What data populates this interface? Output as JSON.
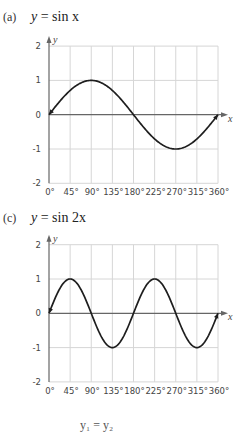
{
  "panels": [
    {
      "label": "(a)",
      "equation_lhs": "y",
      "equation_rhs": "= sin x"
    },
    {
      "label": "(c)",
      "equation_lhs": "y",
      "equation_rhs": "= sin 2x"
    }
  ],
  "footer_fragment": "y₁ = y₂",
  "chart_data": [
    {
      "type": "line",
      "title": "(a) y = sin x",
      "xlabel": "x",
      "ylabel": "y",
      "x_ticks": [
        "0°",
        "45°",
        "90°",
        "135°",
        "180°",
        "225°",
        "270°",
        "315°",
        "360°"
      ],
      "y_ticks": [
        "2",
        "1",
        "0",
        "-1",
        "-2"
      ],
      "xlim": [
        0,
        360
      ],
      "ylim": [
        -2,
        2
      ],
      "grid": true,
      "series": [
        {
          "name": "y = sin x",
          "x": [
            0,
            45,
            90,
            135,
            180,
            225,
            270,
            315,
            360
          ],
          "values": [
            0,
            0.707,
            1,
            0.707,
            0,
            -0.707,
            -1,
            -0.707,
            0
          ]
        }
      ]
    },
    {
      "type": "line",
      "title": "(c) y = sin 2x",
      "xlabel": "x",
      "ylabel": "y",
      "x_ticks": [
        "0°",
        "45°",
        "90°",
        "135°",
        "180°",
        "225°",
        "270°",
        "315°",
        "360°"
      ],
      "y_ticks": [
        "2",
        "1",
        "0",
        "-1",
        "-2"
      ],
      "xlim": [
        0,
        360
      ],
      "ylim": [
        -2,
        2
      ],
      "grid": true,
      "series": [
        {
          "name": "y = sin 2x",
          "x": [
            0,
            45,
            90,
            135,
            180,
            225,
            270,
            315,
            360
          ],
          "values": [
            0,
            1,
            0,
            -1,
            0,
            1,
            0,
            -1,
            0
          ]
        }
      ]
    }
  ]
}
